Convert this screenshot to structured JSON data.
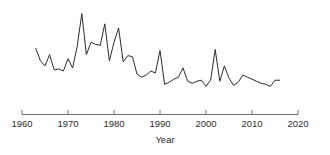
{
  "chart_data": {
    "type": "line",
    "title": "",
    "subtitle": "",
    "xlabel": "Year",
    "ylabel": "",
    "xlim": [
      1960,
      2020
    ],
    "ylim": [
      0,
      100
    ],
    "grid": false,
    "legend": null,
    "axis_color": "#6e6e6e",
    "line_color": "#2b2b2b",
    "x_ticks": [
      1960,
      1970,
      1980,
      1990,
      2000,
      2010,
      2020
    ],
    "x_tick_labels": [
      "1960",
      "1970",
      "1980",
      "1990",
      "2000",
      "2010",
      "2020"
    ],
    "y_ticks": [],
    "y_tick_labels": [],
    "series": [
      {
        "name": "series-1",
        "x": [
          1963,
          1964,
          1965,
          1966,
          1967,
          1968,
          1969,
          1970,
          1971,
          1972,
          1973,
          1974,
          1975,
          1976,
          1977,
          1978,
          1979,
          1980,
          1981,
          1982,
          1983,
          1984,
          1985,
          1986,
          1987,
          1988,
          1989,
          1990,
          1991,
          1992,
          1993,
          1994,
          1995,
          1996,
          1997,
          1998,
          1999,
          2000,
          2001,
          2002,
          2003,
          2004,
          2005,
          2006,
          2007,
          2008,
          2009,
          2010,
          2011,
          2012,
          2013,
          2014,
          2015,
          2016
        ],
        "values": [
          62,
          50,
          45,
          56,
          41,
          42,
          40,
          52,
          43,
          64,
          96,
          56,
          68,
          66,
          65,
          86,
          50,
          68,
          82,
          49,
          55,
          54,
          37,
          34,
          36,
          40,
          38,
          60,
          27,
          29,
          32,
          34,
          43,
          30,
          28,
          30,
          31,
          25,
          31,
          61,
          30,
          45,
          33,
          26,
          29,
          36,
          34,
          32,
          30,
          28,
          27,
          25,
          31,
          31
        ]
      }
    ]
  },
  "axis": {
    "xlabel": "Year"
  }
}
